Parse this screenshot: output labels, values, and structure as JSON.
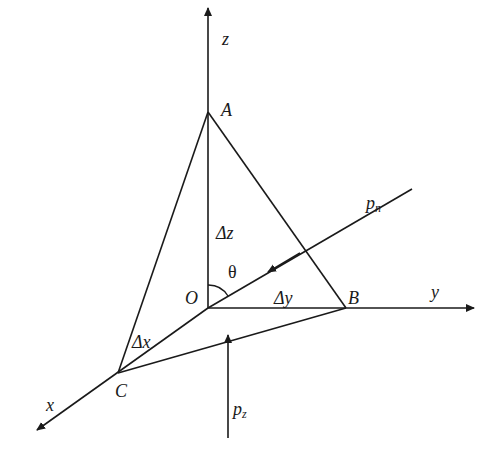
{
  "diagram": {
    "type": "tetrahedron-stress-element",
    "stroke_color": "#1a1a1a",
    "background": "#ffffff",
    "points": {
      "O": [
        208,
        308
      ],
      "A": [
        208,
        112
      ],
      "B": [
        346,
        308
      ],
      "C": [
        118,
        373
      ]
    },
    "axes": {
      "z": {
        "label": "z",
        "from": [
          208,
          308
        ],
        "to": [
          208,
          6
        ]
      },
      "y": {
        "label": "y",
        "from": [
          208,
          308
        ],
        "to": [
          476,
          308
        ]
      },
      "x": {
        "label": "x",
        "from": [
          208,
          308
        ],
        "to": [
          35,
          432
        ]
      }
    },
    "labels": {
      "A": "A",
      "B": "B",
      "C": "C",
      "O": "O",
      "x": "x",
      "y": "y",
      "z": "z",
      "dz": "Δz",
      "dy": "Δy",
      "dx": "Δx",
      "theta": "θ",
      "pn_main": "p",
      "pn_sub": "n",
      "pz_main": "p",
      "pz_sub": "z"
    },
    "forces": {
      "pn": {
        "from": [
          412,
          189
        ],
        "arrow_at": [
          267,
          272
        ],
        "to": [
          208,
          308
        ]
      },
      "pz": {
        "from": [
          228,
          438
        ],
        "to": [
          228,
          333
        ]
      }
    }
  }
}
